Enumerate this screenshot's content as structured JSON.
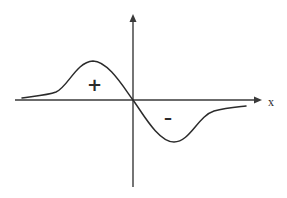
{
  "diagram": {
    "axes": {
      "x_label": "x",
      "origin": [
        133,
        100
      ],
      "horizontal": {
        "from": [
          15,
          100
        ],
        "to": [
          262,
          100
        ],
        "arrow": "right"
      },
      "vertical": {
        "from": [
          133,
          187
        ],
        "to": [
          133,
          14
        ],
        "arrow": "up"
      }
    },
    "regions": {
      "positive": {
        "label": "+",
        "position": [
          88,
          78
        ]
      },
      "negative": {
        "label": "–",
        "position": [
          165,
          109
        ]
      }
    },
    "curve": {
      "path": "M 22 98 C 36 96, 48 95, 56 92 C 68 87, 76 62, 93 61 C 108 61, 124 88, 133 100 C 142 112, 158 142, 174 142 C 190 142, 198 116, 214 111 C 226 108, 238 107, 246 106",
      "peak": [
        93,
        61
      ],
      "trough": [
        174,
        142
      ]
    },
    "colors": {
      "stroke": "#2b2b2b",
      "axis": "#3a3a3a",
      "background": "#ffffff"
    }
  }
}
